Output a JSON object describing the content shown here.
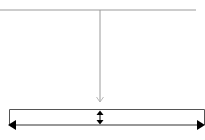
{
  "diagram": {
    "colors": {
      "background": "#ffffff",
      "connector": "#9a9a9a",
      "box_outline": "#555555",
      "dimension_arrow": "#000000"
    },
    "elements": [
      {
        "name": "top-horizontal-line",
        "type": "line",
        "x1": 0,
        "y1": 10,
        "x2": 196,
        "y2": 10
      },
      {
        "name": "vertical-connector",
        "type": "arrow",
        "head": "open",
        "x1": 100,
        "y1": 10,
        "x2": 100,
        "y2": 102
      },
      {
        "name": "outline-box",
        "type": "rect",
        "x": 9,
        "y": 109,
        "width": 195,
        "height": 16
      },
      {
        "name": "vertical-dimension-arrow",
        "type": "double-arrow",
        "x1": 100,
        "y1": 111,
        "x2": 100,
        "y2": 124
      },
      {
        "name": "horizontal-dimension-arrow",
        "type": "double-arrow",
        "x1": 10,
        "y1": 125,
        "x2": 204,
        "y2": 125
      }
    ]
  }
}
